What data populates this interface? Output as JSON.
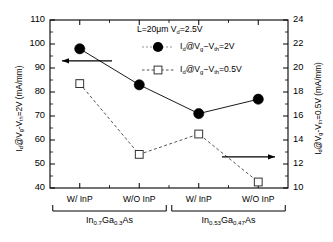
{
  "chart_data": {
    "type": "line",
    "title_html": "L=20μm V<sub>d</sub>=2.5V",
    "categories": [
      "W/ InP",
      "W/O InP",
      "W/ InP",
      "W/O InP"
    ],
    "group_labels": [
      "In<sub>0.7</sub>Ga<sub>0.3</sub>As",
      "In<sub>0.53</sub>Ga<sub>0.47</sub>As"
    ],
    "group_labels_plain": [
      "In0.7Ga0.3As",
      "In0.53Ga0.47As"
    ],
    "xlabel": "",
    "ylabel": "I_d@V_g-V_th=2V (mA/mm)",
    "ylabel_html": "I<sub>d</sub>@V<sub>g</sub>-V<sub>th</sub>=2V (mA/mm)",
    "ylabel_right": "I_d@V_g-V_th=0.5V (mA/mm)",
    "ylabel_right_html": "I<sub>d</sub>@V<sub>g</sub>-V<sub>th</sub>=0.5V (mA/mm)",
    "ylim": [
      40,
      110
    ],
    "ylim_right": [
      10,
      24
    ],
    "yticks": [
      40,
      50,
      60,
      70,
      80,
      90,
      100,
      110
    ],
    "yticks_right": [
      10,
      12,
      14,
      16,
      18,
      20,
      22,
      24
    ],
    "grid": false,
    "legend_position": "upper-right-inside",
    "series": [
      {
        "name": "I_d@V_g-V_th=2V",
        "name_html": "I<sub>d</sub>@V<sub>g</sub>−V<sub>th</sub>=2V",
        "axis": "left",
        "marker": "filled-circle",
        "linestyle": "solid",
        "color": "#000000",
        "values": [
          98,
          83,
          71,
          77
        ]
      },
      {
        "name": "I_d@V_g-V_th=0.5V",
        "name_html": "I<sub>d</sub>@V<sub>g</sub>−V<sub>th</sub>=0.5V",
        "axis": "right",
        "marker": "open-square",
        "linestyle": "dashed",
        "color": "#555555",
        "values": [
          18.7,
          12.8,
          14.5,
          10.5
        ],
        "errorbars": [
          0.3,
          0.25,
          0.0,
          0.0
        ]
      }
    ],
    "annotations": [
      {
        "name": "left-axis-arrow",
        "text": "",
        "direction": "left"
      },
      {
        "name": "right-axis-arrow",
        "text": "",
        "direction": "right"
      }
    ]
  }
}
